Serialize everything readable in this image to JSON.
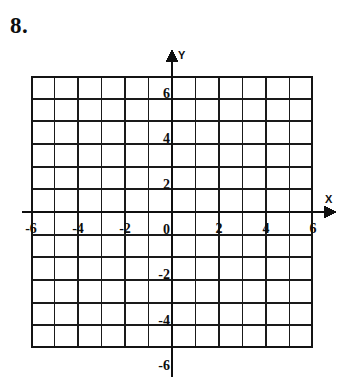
{
  "problem": {
    "number_label": "8."
  },
  "chart_data": {
    "type": "scatter",
    "title": "",
    "subtitle": "",
    "xlabel": "X",
    "ylabel": "Y",
    "grid": true,
    "legend": "none",
    "xlim": [
      -6,
      6
    ],
    "ylim": [
      -6,
      6
    ],
    "x_tick_step": 2,
    "y_tick_step": 2,
    "grid_step": 1,
    "grid_columns": 12,
    "grid_rows": 12,
    "x_tick_labels": [
      "-6",
      "-4",
      "-2",
      "0",
      "2",
      "4",
      "6"
    ],
    "x_tick_values": [
      -6,
      -4,
      -2,
      0,
      2,
      4,
      6
    ],
    "y_tick_labels": [
      "6",
      "4",
      "2",
      "0",
      "-2",
      "-4",
      "-6"
    ],
    "y_tick_values": [
      6,
      4,
      2,
      0,
      -2,
      -4,
      -6
    ],
    "series": [
      {
        "name": "",
        "x": [],
        "y": []
      }
    ],
    "annotations": [],
    "x_axis_arrow": "right",
    "y_axis_arrow": "up",
    "line_color": "#111111",
    "grid_color": "#1a1a1a",
    "background_color": "#ffffff"
  },
  "axis_labels": {
    "x": "X",
    "y": "Y"
  }
}
